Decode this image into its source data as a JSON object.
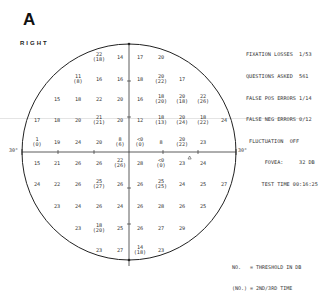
{
  "panel_label": "A",
  "eye": "RIGHT",
  "reliability": {
    "lines": [
      "FIXATION LOSSES  1/53",
      "QUESTIONS ASKED  561",
      "FALSE POS ERRORS 1/14",
      "FALSE NEG ERRORS 0/12",
      " FLUCTUATION  OFF",
      "      FOVEA:     32 DB",
      "     TEST TIME 00:16:25"
    ]
  },
  "legend": {
    "line1": "NO.   = THRESHOLD IN DB",
    "line2": "(NO.) = 2ND/3RD TIME"
  },
  "axis_labels": {
    "left": "30°",
    "right": "30°"
  },
  "grid_values": [
    {
      "r": 0,
      "c": 3,
      "v": "22",
      "s": "(18)"
    },
    {
      "r": 0,
      "c": 4,
      "v": "14"
    },
    {
      "r": 0,
      "c": 5,
      "v": "17"
    },
    {
      "r": 0,
      "c": 6,
      "v": "20"
    },
    {
      "r": 1,
      "c": 2,
      "v": "11",
      "s": "(8)"
    },
    {
      "r": 1,
      "c": 3,
      "v": "16"
    },
    {
      "r": 1,
      "c": 4,
      "v": "16"
    },
    {
      "r": 1,
      "c": 5,
      "v": "18"
    },
    {
      "r": 1,
      "c": 6,
      "v": "20",
      "s": "(22)"
    },
    {
      "r": 1,
      "c": 7,
      "v": "17"
    },
    {
      "r": 2,
      "c": 1,
      "v": "15"
    },
    {
      "r": 2,
      "c": 2,
      "v": "18"
    },
    {
      "r": 2,
      "c": 3,
      "v": "22"
    },
    {
      "r": 2,
      "c": 4,
      "v": "20"
    },
    {
      "r": 2,
      "c": 5,
      "v": "16"
    },
    {
      "r": 2,
      "c": 6,
      "v": "18",
      "s": "(20)"
    },
    {
      "r": 2,
      "c": 7,
      "v": "20",
      "s": "(18)"
    },
    {
      "r": 2,
      "c": 8,
      "v": "22",
      "s": "(26)"
    },
    {
      "r": 3,
      "c": 0,
      "v": "17"
    },
    {
      "r": 3,
      "c": 1,
      "v": "18"
    },
    {
      "r": 3,
      "c": 2,
      "v": "20"
    },
    {
      "r": 3,
      "c": 3,
      "v": "21",
      "s": "(21)"
    },
    {
      "r": 3,
      "c": 4,
      "v": "20"
    },
    {
      "r": 3,
      "c": 5,
      "v": "12"
    },
    {
      "r": 3,
      "c": 6,
      "v": "18",
      "s": "(13)"
    },
    {
      "r": 3,
      "c": 7,
      "v": "20",
      "s": "(24)"
    },
    {
      "r": 3,
      "c": 8,
      "v": "18",
      "s": "(22)"
    },
    {
      "r": 3,
      "c": 9,
      "v": "24"
    },
    {
      "r": 4,
      "c": 0,
      "v": "1",
      "s": "(0)"
    },
    {
      "r": 4,
      "c": 1,
      "v": "19"
    },
    {
      "r": 4,
      "c": 2,
      "v": "24"
    },
    {
      "r": 4,
      "c": 3,
      "v": "20"
    },
    {
      "r": 4,
      "c": 4,
      "v": "8",
      "s": "(6)"
    },
    {
      "r": 4,
      "c": 5,
      "v": "<0",
      "s": "(0)"
    },
    {
      "r": 4,
      "c": 6,
      "v": "8"
    },
    {
      "r": 4,
      "c": 7,
      "v": "20",
      "s": "(22)"
    },
    {
      "r": 4,
      "c": 8,
      "v": "23"
    },
    {
      "r": 5,
      "c": 0,
      "v": "15"
    },
    {
      "r": 5,
      "c": 1,
      "v": "21"
    },
    {
      "r": 5,
      "c": 2,
      "v": "26"
    },
    {
      "r": 5,
      "c": 3,
      "v": "26"
    },
    {
      "r": 5,
      "c": 4,
      "v": "22",
      "s": "(26)"
    },
    {
      "r": 5,
      "c": 5,
      "v": "28"
    },
    {
      "r": 5,
      "c": 6,
      "v": "<0",
      "s": "(0)"
    },
    {
      "r": 5,
      "c": 7,
      "v": "23"
    },
    {
      "r": 5,
      "c": 8,
      "v": "24"
    },
    {
      "r": 6,
      "c": 0,
      "v": "24"
    },
    {
      "r": 6,
      "c": 1,
      "v": "22"
    },
    {
      "r": 6,
      "c": 2,
      "v": "26"
    },
    {
      "r": 6,
      "c": 3,
      "v": "25",
      "s": "(27)"
    },
    {
      "r": 6,
      "c": 4,
      "v": "26"
    },
    {
      "r": 6,
      "c": 5,
      "v": "26"
    },
    {
      "r": 6,
      "c": 6,
      "v": "25",
      "s": "(25)"
    },
    {
      "r": 6,
      "c": 7,
      "v": "24"
    },
    {
      "r": 6,
      "c": 8,
      "v": "25"
    },
    {
      "r": 6,
      "c": 9,
      "v": "27"
    },
    {
      "r": 7,
      "c": 1,
      "v": "23"
    },
    {
      "r": 7,
      "c": 2,
      "v": "24"
    },
    {
      "r": 7,
      "c": 3,
      "v": "26"
    },
    {
      "r": 7,
      "c": 4,
      "v": "24"
    },
    {
      "r": 7,
      "c": 5,
      "v": "26"
    },
    {
      "r": 7,
      "c": 6,
      "v": "28"
    },
    {
      "r": 7,
      "c": 7,
      "v": "26"
    },
    {
      "r": 7,
      "c": 8,
      "v": "25"
    },
    {
      "r": 8,
      "c": 2,
      "v": "23"
    },
    {
      "r": 8,
      "c": 3,
      "v": "18",
      "s": "(20)"
    },
    {
      "r": 8,
      "c": 4,
      "v": "25"
    },
    {
      "r": 8,
      "c": 5,
      "v": "26"
    },
    {
      "r": 8,
      "c": 6,
      "v": "27"
    },
    {
      "r": 8,
      "c": 7,
      "v": "29"
    },
    {
      "r": 9,
      "c": 3,
      "v": "23"
    },
    {
      "r": 9,
      "c": 4,
      "v": "27"
    },
    {
      "r": 9,
      "c": 5,
      "v": "14",
      "s": "(18)"
    },
    {
      "r": 9,
      "c": 6,
      "v": "23"
    }
  ]
}
